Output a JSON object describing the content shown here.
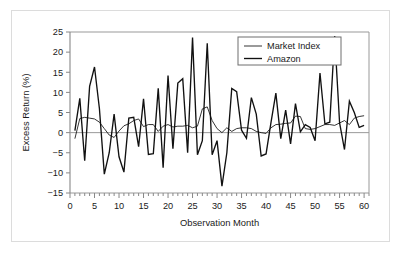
{
  "figure": {
    "background_color": "#ffffff",
    "border_color": "#dcdcdc"
  },
  "chart_data": {
    "type": "line",
    "title": "",
    "xlabel": "Observation Month",
    "ylabel": "Excess Return (%)",
    "xlim": [
      0,
      61
    ],
    "ylim": [
      -15,
      25
    ],
    "xticks": [
      0,
      5,
      10,
      15,
      20,
      25,
      30,
      35,
      40,
      45,
      50,
      55,
      60
    ],
    "xtick_labels": [
      "0",
      "5",
      "10",
      "15",
      "20",
      "25",
      "30",
      "35",
      "40",
      "45",
      "50",
      "55",
      "60"
    ],
    "x_minor_tick_step": 1,
    "yticks": [
      -15,
      -10,
      -5,
      0,
      5,
      10,
      15,
      20,
      25
    ],
    "ytick_labels": [
      "−15",
      "−10",
      "−5",
      "0",
      "5",
      "10",
      "15",
      "20",
      "25"
    ],
    "grid": false,
    "zero_line": true,
    "legend_position": "top-right",
    "x": [
      1,
      2,
      3,
      4,
      5,
      6,
      7,
      8,
      9,
      10,
      11,
      12,
      13,
      14,
      15,
      16,
      17,
      18,
      19,
      20,
      21,
      22,
      23,
      24,
      25,
      26,
      27,
      28,
      29,
      30,
      31,
      32,
      33,
      34,
      35,
      36,
      37,
      38,
      39,
      40,
      41,
      42,
      43,
      44,
      45,
      46,
      47,
      48,
      49,
      50,
      51,
      52,
      53,
      54,
      55,
      56,
      57,
      58,
      59,
      60
    ],
    "series": [
      {
        "name": "Market Index",
        "color": "#111111",
        "line_width": 0.85,
        "values": [
          -1.5,
          3.5,
          3.8,
          3.6,
          3.4,
          2.6,
          1.0,
          -0.6,
          -1.2,
          0.4,
          1.7,
          2.2,
          3.0,
          3.4,
          1.5,
          2.0,
          2.0,
          0.3,
          1.6,
          2.0,
          1.4,
          1.6,
          1.6,
          1.8,
          1.2,
          1.6,
          5.9,
          6.4,
          3.0,
          1.0,
          0.0,
          1.2,
          0.3,
          1.0,
          1.2,
          1.2,
          1.0,
          0.3,
          0.0,
          -0.2,
          1.2,
          2.0,
          2.1,
          2.3,
          2.4,
          4.1,
          4.0,
          1.0,
          0.8,
          1.0,
          1.5,
          2.0,
          2.0,
          1.8,
          2.4,
          3.0,
          2.0,
          3.6,
          4.0,
          4.2
        ]
      },
      {
        "name": "Amazon",
        "color": "#111111",
        "line_width": 1.35,
        "values": [
          0.5,
          8.5,
          -7.0,
          11.5,
          16.3,
          6.0,
          -10.3,
          -5.0,
          4.6,
          -6.0,
          -9.8,
          3.6,
          3.8,
          -3.5,
          8.4,
          -5.4,
          -5.2,
          11.0,
          -8.7,
          14.2,
          -4.0,
          12.3,
          13.4,
          -5.0,
          23.6,
          -5.5,
          -2.0,
          22.2,
          -5.5,
          -2.0,
          -13.3,
          -5.0,
          11.0,
          10.2,
          0.6,
          -1.4,
          8.7,
          4.6,
          -5.8,
          -5.3,
          2.5,
          9.8,
          -1.5,
          5.6,
          -2.8,
          7.2,
          0.2,
          2.0,
          1.3,
          -2.0,
          14.8,
          2.2,
          2.6,
          24.0,
          2.4,
          -4.2,
          7.8,
          5.0,
          1.3,
          1.8
        ]
      }
    ]
  },
  "legend": {
    "items": [
      {
        "label": "Market Index"
      },
      {
        "label": "Amazon"
      }
    ]
  },
  "axes": {
    "x_title": "Observation Month",
    "y_title": "Excess Return (%)"
  }
}
